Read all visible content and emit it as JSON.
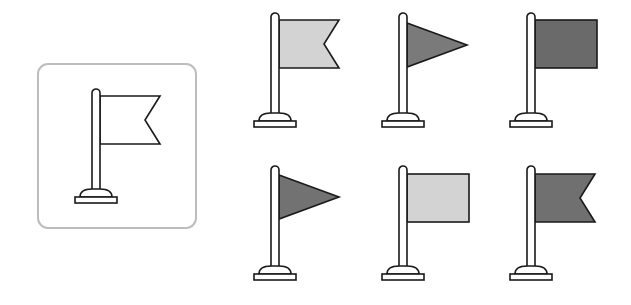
{
  "colors": {
    "stroke": "#1a1a1a",
    "box_border": "#bdbdbd",
    "light_fill": "#d3d3d3",
    "dark_fill": "#6e6e6e"
  },
  "reference": {
    "shape": "swallowtail",
    "fill": "none"
  },
  "options": [
    {
      "shape": "swallowtail",
      "fill": "light"
    },
    {
      "shape": "triangle",
      "fill": "dark"
    },
    {
      "shape": "rectangle",
      "fill": "dark"
    },
    {
      "shape": "triangle",
      "fill": "dark"
    },
    {
      "shape": "rectangle",
      "fill": "light"
    },
    {
      "shape": "swallowtail",
      "fill": "dark"
    }
  ]
}
